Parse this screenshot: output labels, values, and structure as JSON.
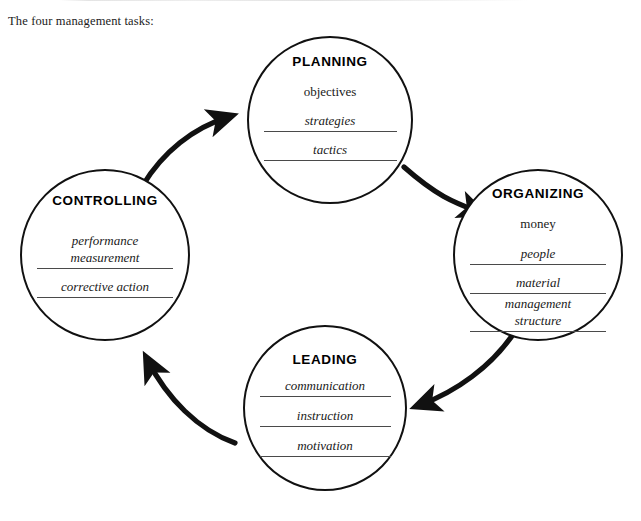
{
  "caption": "The four management tasks:",
  "diagram": {
    "type": "cycle",
    "flow_direction": "clockwise",
    "line_color": "#111111",
    "rule_color": "#4a4a4a",
    "text_color": "#1a1a1a",
    "background": "#ffffff",
    "nodes": [
      {
        "id": "planning",
        "title": "PLANNING",
        "cx": 330,
        "cy": 120,
        "rx": 83,
        "ry": 84,
        "title_top": 16,
        "items": [
          {
            "text": "objectives",
            "style": "plain",
            "rule": false,
            "gap": 14
          },
          {
            "text": "strategies",
            "style": "italic",
            "rule": true,
            "gap": 12
          },
          {
            "text": "tactics",
            "style": "italic",
            "rule": true,
            "gap": 9
          }
        ]
      },
      {
        "id": "organizing",
        "title": "ORGANIZING",
        "cx": 538,
        "cy": 255,
        "rx": 85,
        "ry": 86,
        "title_top": 15,
        "items": [
          {
            "text": "money",
            "style": "plain",
            "rule": false,
            "gap": 14
          },
          {
            "text": "people",
            "style": "italic",
            "rule": true,
            "gap": 13
          },
          {
            "text": "material",
            "style": "italic",
            "rule": true,
            "gap": 9
          },
          {
            "text": "management\nstructure",
            "style": "italic",
            "rule": true,
            "gap": 1
          }
        ]
      },
      {
        "id": "leading",
        "title": "LEADING",
        "cx": 325,
        "cy": 408,
        "rx": 82,
        "ry": 83,
        "title_top": 25,
        "items": [
          {
            "text": "communication",
            "style": "italic",
            "rule": true,
            "gap": 10
          },
          {
            "text": "instruction",
            "style": "italic",
            "rule": true,
            "gap": 10
          },
          {
            "text": "motivation",
            "style": "italic",
            "rule": true,
            "gap": 10
          }
        ]
      },
      {
        "id": "controlling",
        "title": "CONTROLLING",
        "cx": 105,
        "cy": 255,
        "rx": 85,
        "ry": 86,
        "title_top": 22,
        "items": [
          {
            "text": "performance\nmeasurement",
            "style": "italic",
            "rule": true,
            "gap": 24
          },
          {
            "text": "corrective action",
            "style": "italic",
            "rule": true,
            "gap": 9
          }
        ]
      }
    ],
    "arrows": [
      {
        "id": "planning-to-organizing",
        "from": "planning",
        "to": "organizing",
        "path": "M 404 167 C 437 196 453 202 479 212"
      },
      {
        "id": "organizing-to-leading",
        "from": "organizing",
        "to": "leading",
        "path": "M 516 330 C 492 367 455 392 420 405"
      },
      {
        "id": "leading-to-controlling",
        "from": "leading",
        "to": "controlling",
        "path": "M 235 443 C 198 430 167 398 148 361"
      },
      {
        "id": "controlling-to-planning",
        "from": "controlling",
        "to": "planning",
        "path": "M 143 185 C 163 152 193 128 228 117"
      }
    ]
  }
}
